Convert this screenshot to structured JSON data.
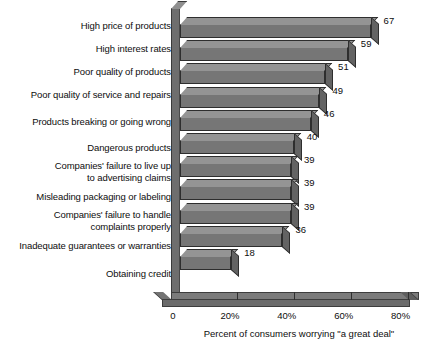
{
  "chart_data": {
    "type": "bar",
    "orientation": "horizontal",
    "title": "",
    "xlabel": "Percent of consumers worrying \"a great deal\"",
    "ylabel": "",
    "xlim": [
      0,
      87
    ],
    "grid": false,
    "legend": false,
    "xticks": [
      {
        "value": 0,
        "label": "0"
      },
      {
        "value": 20,
        "label": "20%"
      },
      {
        "value": 40,
        "label": "40%"
      },
      {
        "value": 60,
        "label": "60%"
      },
      {
        "value": 80,
        "label": "80%"
      }
    ],
    "categories": [
      "High price of products",
      "High interest rates",
      "Poor quality of products",
      "Poor quality of service and repairs",
      "Products breaking or going wrong",
      "Dangerous products",
      "Companies' failure to live up\nto advertising claims",
      "Misleading packaging or labeling",
      "Companies' failure to handle\ncomplaints properly",
      "Inadequate guarantees or warranties",
      "Obtaining credit"
    ],
    "values": [
      67,
      59,
      51,
      49,
      46,
      40,
      39,
      39,
      39,
      36,
      18
    ],
    "value_labels": [
      "67",
      "59",
      "51",
      "49",
      "46",
      "40",
      "39",
      "39",
      "39",
      "36",
      "18"
    ],
    "colors": {
      "bar_front": "#767676",
      "bar_top": "#949494",
      "bar_cap": "#636363",
      "outline": "#2e2e2e",
      "floor": "#7b7b7b",
      "wall": "#6e6e6e",
      "background": "#ffffff",
      "text": "#0d0d0d"
    }
  }
}
